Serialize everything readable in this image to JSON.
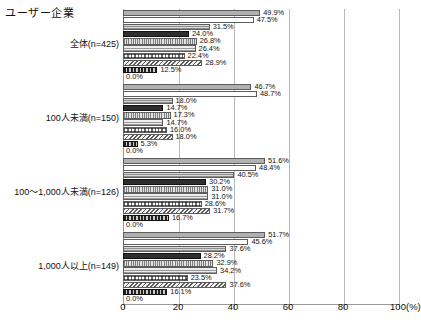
{
  "chart_data": {
    "type": "bar",
    "orientation": "horizontal",
    "title": "ユーザー企業",
    "xlabel": "",
    "ylabel": "",
    "xunit": "(%)",
    "xlim": [
      0,
      100
    ],
    "xticks": [
      0,
      20,
      40,
      60,
      80,
      100
    ],
    "xtick_labels": [
      "0",
      "20",
      "40",
      "60",
      "80",
      "100"
    ],
    "grid": true,
    "grid_axis": "x",
    "legend": false,
    "categories": [
      "全体(n=425)",
      "100人未満(n=150)",
      "100〜1,000人未満(n=126)",
      "1,000人以上(n=149)"
    ],
    "series_count": 10,
    "groups": [
      {
        "label": "全体(n=425)",
        "values": [
          49.9,
          47.5,
          31.5,
          24.0,
          26.8,
          26.4,
          22.4,
          28.9,
          12.5,
          0.0
        ],
        "value_labels": [
          "49.9%",
          "47.5%",
          "31.5%",
          "24.0%",
          "26.8%",
          "26.4%",
          "22.4%",
          "28.9%",
          "12.5%",
          "0.0%"
        ]
      },
      {
        "label": "100人未満(n=150)",
        "values": [
          46.7,
          48.7,
          18.0,
          14.7,
          17.3,
          14.7,
          16.0,
          18.0,
          5.3,
          0.0
        ],
        "value_labels": [
          "46.7%",
          "48.7%",
          "18.0%",
          "14.7%",
          "17.3%",
          "14.7%",
          "16.0%",
          "18.0%",
          "5.3%",
          "0.0%"
        ]
      },
      {
        "label": "100〜1,000人未満(n=126)",
        "values": [
          51.6,
          48.4,
          40.5,
          30.2,
          31.0,
          31.0,
          28.6,
          31.7,
          16.7,
          0.0
        ],
        "value_labels": [
          "51.6%",
          "48.4%",
          "40.5%",
          "30.2%",
          "31.0%",
          "31.0%",
          "28.6%",
          "31.7%",
          "16.7%",
          "0.0%"
        ]
      },
      {
        "label": "1,000人以上(n=149)",
        "values": [
          51.7,
          45.6,
          37.6,
          28.2,
          32.9,
          34.2,
          23.5,
          37.6,
          16.1,
          0.0
        ],
        "value_labels": [
          "51.7%",
          "45.6%",
          "37.6%",
          "28.2%",
          "32.9%",
          "34.2%",
          "23.5%",
          "37.6%",
          "16.1%",
          "0.0%"
        ]
      }
    ]
  },
  "colors": {
    "axis": "#9a9a9a",
    "grid": "#b9b9b9",
    "text": "#111111",
    "background": "#ffffff"
  }
}
